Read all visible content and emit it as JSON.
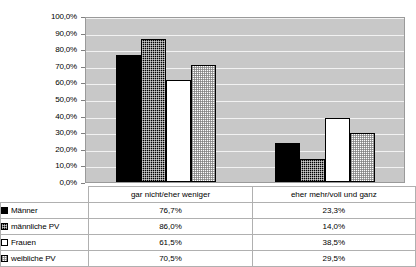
{
  "title": "",
  "chart_data": {
    "type": "bar",
    "title": "",
    "subtitle": "",
    "xlabel": "",
    "ylabel": "",
    "ylim": [
      0,
      100
    ],
    "grid": true,
    "legend_position": "table-below",
    "categories": [
      "gar nicht/eher weniger",
      "eher mehr/voll und ganz"
    ],
    "y_ticks": [
      "0,0%",
      "10,0%",
      "20,0%",
      "30,0%",
      "40,0%",
      "50,0%",
      "60,0%",
      "70,0%",
      "80,0%",
      "90,0%",
      "100,0%"
    ],
    "y_tick_values": [
      0,
      10,
      20,
      30,
      40,
      50,
      60,
      70,
      80,
      90,
      100
    ],
    "series": [
      {
        "name": "Männer",
        "swatch": "solid-black",
        "values": [
          76.7,
          23.3
        ],
        "labels": [
          "76,7%",
          "23,3%"
        ]
      },
      {
        "name": "männliche PV",
        "swatch": "dotted-black",
        "values": [
          86.0,
          14.0
        ],
        "labels": [
          "86,0%",
          "14,0%"
        ]
      },
      {
        "name": "Frauen",
        "swatch": "white",
        "values": [
          61.5,
          38.5
        ],
        "labels": [
          "61,5%",
          "38,5%"
        ]
      },
      {
        "name": "weibliche PV",
        "swatch": "dotted-white",
        "values": [
          70.5,
          29.5
        ],
        "labels": [
          "70,5%",
          "29,5%"
        ]
      }
    ]
  },
  "colors": {
    "plot_background": "#c8c8c8",
    "gridline": "#f2f2f2",
    "plot_border": "#9a9a9a",
    "table_border": "#b0b0b0",
    "series_dark": "#000000",
    "series_light": "#ffffff",
    "page_background": "#ffffff"
  }
}
